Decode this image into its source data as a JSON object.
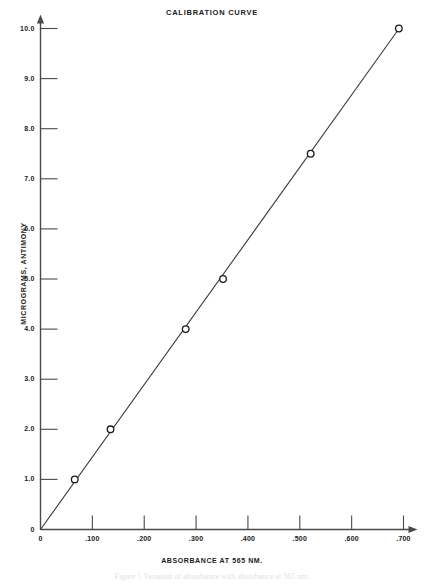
{
  "chart_data": {
    "type": "scatter",
    "title": "CALIBRATION CURVE",
    "xlabel": "ABSORBANCE AT 565 NM.",
    "ylabel": "MICROGRAMS, ANTIMONY",
    "xlim": [
      0,
      0.7
    ],
    "ylim": [
      0,
      10.0
    ],
    "grid": false,
    "legend": null,
    "marker": "open-circle",
    "line": "straight-fit-line",
    "xticks": [
      {
        "value": 0,
        "label": "0"
      },
      {
        "value": 0.1,
        "label": ".100"
      },
      {
        "value": 0.2,
        "label": ".200"
      },
      {
        "value": 0.3,
        "label": ".300"
      },
      {
        "value": 0.4,
        "label": ".400"
      },
      {
        "value": 0.5,
        "label": ".500"
      },
      {
        "value": 0.6,
        "label": ".600"
      },
      {
        "value": 0.7,
        "label": ".700"
      }
    ],
    "yticks": [
      {
        "value": 0,
        "label": "0"
      },
      {
        "value": 1.0,
        "label": "1.0"
      },
      {
        "value": 2.0,
        "label": "2.0"
      },
      {
        "value": 3.0,
        "label": "3.0"
      },
      {
        "value": 4.0,
        "label": "4.0"
      },
      {
        "value": 5.0,
        "label": "5.0"
      },
      {
        "value": 6.0,
        "label": "6.0"
      },
      {
        "value": 7.0,
        "label": "7.0"
      },
      {
        "value": 8.0,
        "label": "8.0"
      },
      {
        "value": 9.0,
        "label": "9.0"
      },
      {
        "value": 10.0,
        "label": "10.0"
      }
    ],
    "series": [
      {
        "name": "antimony standards",
        "x": [
          0.066,
          0.135,
          0.28,
          0.352,
          0.521,
          0.691
        ],
        "y": [
          1.0,
          2.0,
          4.0,
          5.0,
          7.5,
          10.0
        ]
      }
    ],
    "fit_line": {
      "x": [
        0.0,
        0.695
      ],
      "y": [
        0.0,
        10.05
      ]
    }
  },
  "caption": {
    "text": "Figure 1 Variation of absorbance with absorbance at 565 nm."
  },
  "colors": {
    "axis": "#4a4a4a",
    "line": "#3a3a3a",
    "marker_edge": "#1a1a1a",
    "text": "#1a1a1a",
    "background": "#ffffff"
  }
}
